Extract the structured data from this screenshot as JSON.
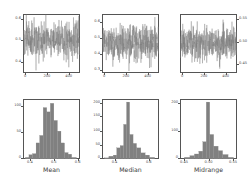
{
  "figure": {
    "title": "",
    "background": "#ffffff",
    "series_color": "#7a7a7a",
    "hist_color": "#808080",
    "axis_color": "#555555",
    "rows": 2,
    "cols": 3
  },
  "chart_data": [
    {
      "type": "line",
      "name": "mean-timeseries",
      "title": "",
      "xlabel": "",
      "ylabel": "",
      "xlim": [
        0,
        500
      ],
      "ylim": [
        0.35,
        0.62
      ],
      "xticks": [
        0,
        200,
        400
      ],
      "xticklabels": [
        "0",
        "200",
        "400"
      ],
      "yticks": [
        0.4,
        0.5,
        0.6
      ],
      "yticklabels": [
        "0.4",
        "0.5",
        "0.6"
      ],
      "grid": false,
      "legend": "none",
      "description": "Dense random noise sequence of 500 bootstrap sample means fluctuating about 0.5",
      "center": 0.5,
      "spread": 0.04,
      "n_points": 500,
      "seed": 11
    },
    {
      "type": "line",
      "name": "median-timeseries",
      "title": "",
      "xlabel": "",
      "ylabel": "",
      "xlim": [
        0,
        500
      ],
      "ylim": [
        0.28,
        0.65
      ],
      "xticks": [
        0,
        200,
        400
      ],
      "xticklabels": [
        "0",
        "200",
        "400"
      ],
      "yticks": [
        0.3,
        0.4,
        0.5,
        0.6
      ],
      "yticklabels": [
        "0.3",
        "0.4",
        "0.5",
        "0.6"
      ],
      "grid": false,
      "legend": "none",
      "description": "Dense random noise sequence of 500 bootstrap sample medians fluctuating about 0.5",
      "center": 0.47,
      "spread": 0.055,
      "n_points": 500,
      "seed": 27
    },
    {
      "type": "line",
      "name": "midrange-timeseries",
      "title": "",
      "xlabel": "",
      "ylabel": "",
      "xlim": [
        0,
        500
      ],
      "ylim": [
        0.435,
        0.565
      ],
      "xticks": [
        0,
        200,
        400
      ],
      "xticklabels": [
        "0",
        "200",
        "400"
      ],
      "yticks": [
        0.45,
        0.5,
        0.55
      ],
      "yticklabels": [
        "0.45",
        "0.50",
        "0.55"
      ],
      "grid": false,
      "legend": "none",
      "description": "Dense random noise sequence of 500 bootstrap midrange values fluctuating about 0.50",
      "center": 0.5,
      "spread": 0.019,
      "n_points": 500,
      "seed": 43
    },
    {
      "type": "bar",
      "name": "mean-histogram",
      "title": "",
      "xlabel": "Mean",
      "ylabel": "",
      "xlim": [
        0.375,
        0.615
      ],
      "ylim": [
        0,
        112
      ],
      "xticks": [
        0.4,
        0.5,
        0.6
      ],
      "xticklabels": [
        "0.4",
        "0.5",
        "0.6"
      ],
      "yticks": [
        0,
        50,
        100
      ],
      "yticklabels": [
        "0",
        "50",
        "100"
      ],
      "grid": false,
      "legend": "none",
      "bin_edges": [
        0.385,
        0.4,
        0.415,
        0.43,
        0.445,
        0.46,
        0.475,
        0.49,
        0.505,
        0.52,
        0.535,
        0.55,
        0.565,
        0.58,
        0.6
      ],
      "categories": [
        "0.385-0.400",
        "0.400-0.415",
        "0.415-0.430",
        "0.430-0.445",
        "0.445-0.460",
        "0.460-0.475",
        "0.475-0.490",
        "0.490-0.505",
        "0.505-0.520",
        "0.520-0.535",
        "0.535-0.550",
        "0.550-0.565",
        "0.565-0.580",
        "0.580-0.600"
      ],
      "values": [
        3,
        8,
        10,
        30,
        44,
        96,
        88,
        104,
        72,
        52,
        30,
        12,
        9,
        3
      ]
    },
    {
      "type": "bar",
      "name": "median-histogram",
      "title": "",
      "xlabel": "Median",
      "ylabel": "",
      "xlim": [
        0.33,
        0.66
      ],
      "ylim": [
        0,
        215
      ],
      "xticks": [
        0.4,
        0.6
      ],
      "xticklabels": [
        "0.4",
        "0.6"
      ],
      "yticks": [
        0,
        50,
        100,
        150,
        200
      ],
      "yticklabels": [
        "0",
        "50",
        "100",
        "150",
        "200"
      ],
      "grid": false,
      "legend": "none",
      "bin_edges": [
        0.345,
        0.37,
        0.395,
        0.415,
        0.435,
        0.455,
        0.472,
        0.49,
        0.51,
        0.53,
        0.555,
        0.58,
        0.605,
        0.635
      ],
      "categories": [
        "0.345-0.370",
        "0.370-0.395",
        "0.395-0.415",
        "0.415-0.435",
        "0.435-0.455",
        "0.455-0.472",
        "0.472-0.490",
        "0.490-0.510",
        "0.510-0.530",
        "0.530-0.555",
        "0.555-0.580",
        "0.580-0.605",
        "0.605-0.635"
      ],
      "values": [
        4,
        10,
        14,
        40,
        48,
        124,
        204,
        88,
        56,
        40,
        22,
        14,
        6
      ]
    },
    {
      "type": "bar",
      "name": "midrange-histogram",
      "title": "",
      "xlabel": "Midrange",
      "ylabel": "",
      "xlim": [
        0.443,
        0.558
      ],
      "ylim": [
        0,
        215
      ],
      "xticks": [
        0.45,
        0.5,
        0.55
      ],
      "xticklabels": [
        "0.45",
        "0.50",
        "0.55"
      ],
      "yticks": [
        0,
        100,
        200
      ],
      "yticklabels": [
        "0",
        "100",
        "200"
      ],
      "grid": false,
      "legend": "none",
      "bin_edges": [
        0.452,
        0.463,
        0.472,
        0.481,
        0.489,
        0.496,
        0.503,
        0.511,
        0.52,
        0.529,
        0.54,
        0.551
      ],
      "categories": [
        "0.452-0.463",
        "0.463-0.472",
        "0.472-0.481",
        "0.481-0.489",
        "0.489-0.496",
        "0.496-0.503",
        "0.503-0.511",
        "0.511-0.520",
        "0.520-0.529",
        "0.529-0.540",
        "0.540-0.551"
      ],
      "values": [
        6,
        12,
        18,
        28,
        62,
        204,
        88,
        46,
        30,
        16,
        6
      ]
    }
  ]
}
